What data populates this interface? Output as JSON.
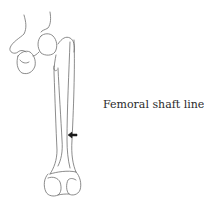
{
  "figure": {
    "label": "Femoral shaft line",
    "line_color": "#6e6e6e",
    "arrow_color": "#1a1a1a",
    "arrow_direction": "left"
  }
}
